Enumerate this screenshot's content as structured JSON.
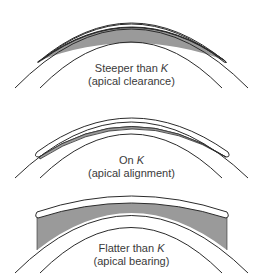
{
  "colors": {
    "line": "#2b2b2b",
    "tear_film": "#9a9a9a",
    "lens_fill": "#ffffff",
    "background": "#ffffff",
    "text": "#3a3a3a"
  },
  "panels": [
    {
      "id": "steeper",
      "title_prefix": "Steeper than ",
      "title_symbol": "K",
      "subtitle": "(apical clearance)"
    },
    {
      "id": "on-k",
      "title_prefix": "On ",
      "title_symbol": "K",
      "subtitle": "(apical alignment)"
    },
    {
      "id": "flatter",
      "title_prefix": "Flatter than ",
      "title_symbol": "K",
      "subtitle": "(apical bearing)"
    }
  ]
}
